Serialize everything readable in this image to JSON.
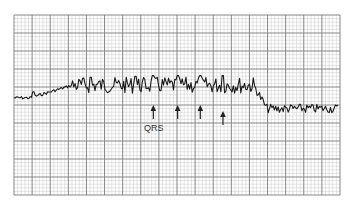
{
  "figure": {
    "type": "ecg_strip",
    "qrs_label": "QRS",
    "colors": {
      "paper": "#ffffff",
      "minor_grid": "#c8c8c8",
      "major_grid": "#7a7a7a",
      "trace": "#1a1a1a",
      "annotation": "#222222"
    },
    "grid": {
      "minor_divisions_per_major": 5,
      "major_columns": 18,
      "major_rows": 10
    },
    "qrs_markers": [
      {
        "index": 1,
        "time_fraction": 0.43,
        "labeled": true
      },
      {
        "index": 2,
        "time_fraction": 0.505,
        "labeled": false
      },
      {
        "index": 3,
        "time_fraction": 0.575,
        "labeled": false
      },
      {
        "index": 4,
        "time_fraction": 0.645,
        "labeled": false
      }
    ],
    "trace": {
      "segments": [
        {
          "name": "initial-baseline",
          "start_fraction": 0.0,
          "end_fraction": 0.18,
          "baseline_level": 0.0,
          "noise": "low"
        },
        {
          "name": "fibrillatory-segment",
          "start_fraction": 0.18,
          "end_fraction": 0.74,
          "baseline_level": 0.07,
          "noise": "high"
        },
        {
          "name": "late-segment",
          "start_fraction": 0.74,
          "end_fraction": 1.0,
          "baseline_level": -0.06,
          "noise": "medium"
        }
      ]
    }
  }
}
